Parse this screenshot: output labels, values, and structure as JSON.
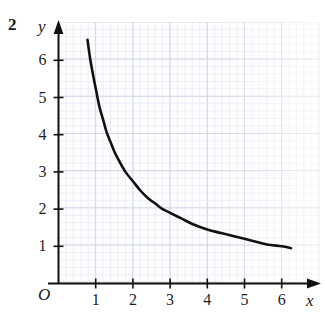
{
  "figure": {
    "question_number": "2",
    "origin_label": "O"
  },
  "chart_data": {
    "type": "line",
    "title": "",
    "subtitle": "",
    "xlabel": "x",
    "ylabel": "y",
    "grid": true,
    "legend": "none",
    "xlim": [
      0,
      7
    ],
    "ylim": [
      0,
      7
    ],
    "x_ticks": [
      1,
      2,
      3,
      4,
      5,
      6
    ],
    "y_ticks": [
      1,
      2,
      3,
      4,
      5,
      6
    ],
    "x_tick_labels": [
      "1",
      "2",
      "3",
      "4",
      "5",
      "6"
    ],
    "y_tick_labels": [
      "1",
      "2",
      "3",
      "4",
      "5",
      "6"
    ],
    "annotations": [],
    "series": [
      {
        "name": "curve",
        "color": "#111111",
        "x": [
          0.78,
          0.85,
          0.95,
          1.0,
          1.1,
          1.2,
          1.3,
          1.4,
          1.5,
          1.6,
          1.8,
          2.0,
          2.2,
          2.4,
          2.6,
          2.8,
          3.0,
          3.3,
          3.6,
          4.0,
          4.4,
          4.8,
          5.2,
          5.6,
          6.0,
          6.25
        ],
        "y": [
          6.55,
          6.05,
          5.5,
          5.25,
          4.75,
          4.4,
          4.05,
          3.8,
          3.55,
          3.35,
          3.0,
          2.75,
          2.5,
          2.3,
          2.15,
          2.0,
          1.9,
          1.75,
          1.6,
          1.45,
          1.35,
          1.25,
          1.15,
          1.05,
          1.0,
          0.95
        ]
      }
    ]
  },
  "axes": {
    "x_axis_name": "x",
    "y_axis_name": "y"
  }
}
